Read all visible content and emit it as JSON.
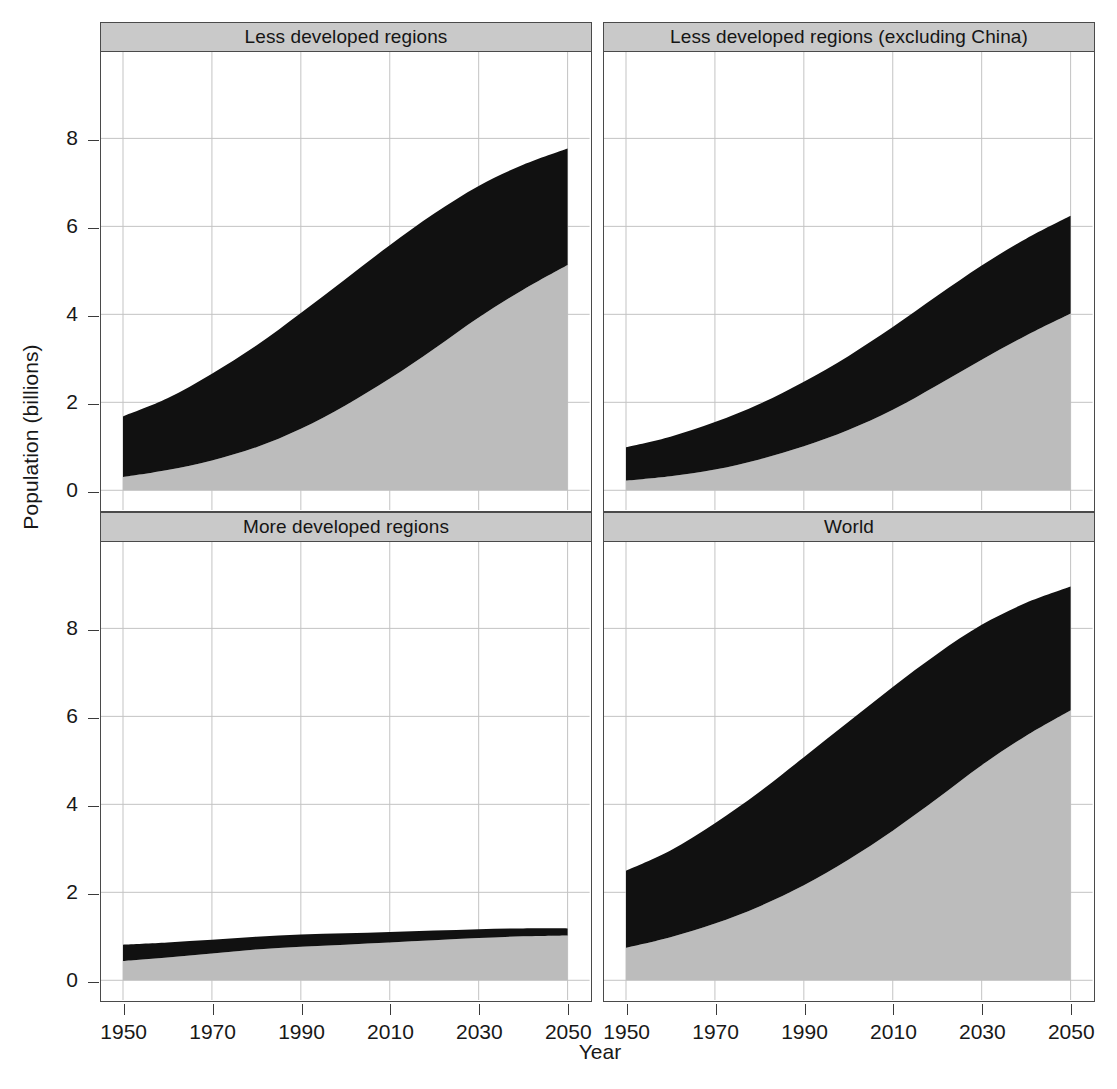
{
  "figure": {
    "x_axis_title": "Year",
    "y_axis_title": "Population (billions)"
  },
  "axes": {
    "y_ticks": [
      "0",
      "2",
      "4",
      "6",
      "8"
    ],
    "x_ticks": [
      "1950",
      "1970",
      "1990",
      "2010",
      "2030",
      "2050"
    ]
  },
  "panels": [
    {
      "key": "less_developed",
      "title": "Less developed regions"
    },
    {
      "key": "less_developed_excl_china",
      "title": "Less developed regions (excluding China)"
    },
    {
      "key": "more_developed",
      "title": "More developed regions"
    },
    {
      "key": "world",
      "title": "World"
    }
  ],
  "colors": {
    "urban_fill": "#bcbcbc",
    "rural_fill": "#111111",
    "panel_strip": "#c9c9c9",
    "panel_border": "#4a4a4a",
    "gridline": "#c3c3c3",
    "background": "#ffffff",
    "text": "#181818"
  },
  "chart_data": {
    "type": "area",
    "title": "",
    "subtitle": "",
    "xlabel": "Year",
    "ylabel": "Population (billions)",
    "xlim": [
      1950,
      2050
    ],
    "ylim": [
      0,
      9.6
    ],
    "grid": true,
    "legend": "none",
    "stacked": true,
    "series_names": [
      "Urban",
      "Rural"
    ],
    "series_colors": [
      "#bcbcbc",
      "#111111"
    ],
    "x": [
      1950,
      1960,
      1970,
      1980,
      1990,
      2000,
      2010,
      2020,
      2030,
      2040,
      2050
    ],
    "panels": [
      {
        "name": "Less developed regions",
        "xlabel": "Year",
        "ylabel": "Population (billions)",
        "series": [
          {
            "name": "Urban",
            "values": [
              0.3,
              0.46,
              0.68,
              0.98,
              1.4,
              1.93,
              2.54,
              3.22,
              3.93,
              4.56,
              5.12
            ]
          },
          {
            "name": "Rural",
            "values": [
              1.38,
              1.63,
              1.97,
              2.31,
              2.63,
              2.87,
              3.03,
              3.07,
              2.99,
              2.84,
              2.65
            ]
          }
        ],
        "totals": [
          1.68,
          2.09,
          2.65,
          3.29,
          4.03,
          4.8,
          5.57,
          6.29,
          6.92,
          7.4,
          7.77
        ]
      },
      {
        "name": "Less developed regions (excluding China)",
        "xlabel": "Year",
        "ylabel": "Population (billions)",
        "series": [
          {
            "name": "Urban",
            "values": [
              0.22,
              0.32,
              0.47,
              0.7,
              1.0,
              1.37,
              1.83,
              2.39,
              2.97,
              3.52,
              4.02
            ]
          },
          {
            "name": "Rural",
            "values": [
              0.76,
              0.9,
              1.08,
              1.26,
              1.47,
              1.68,
              1.88,
              2.03,
              2.14,
              2.2,
              2.22
            ]
          }
        ],
        "totals": [
          0.98,
          1.22,
          1.55,
          1.96,
          2.47,
          3.05,
          3.71,
          4.42,
          5.11,
          5.72,
          6.24
        ]
      },
      {
        "name": "More developed regions",
        "xlabel": "Year",
        "ylabel": "Population (billions)",
        "series": [
          {
            "name": "Urban",
            "values": [
              0.44,
              0.52,
              0.61,
              0.7,
              0.76,
              0.81,
              0.86,
              0.91,
              0.96,
              1.0,
              1.02
            ]
          },
          {
            "name": "Rural",
            "values": [
              0.37,
              0.34,
              0.31,
              0.29,
              0.28,
              0.26,
              0.24,
              0.22,
              0.2,
              0.18,
              0.16
            ]
          }
        ],
        "totals": [
          0.81,
          0.86,
          0.92,
          0.99,
          1.04,
          1.07,
          1.1,
          1.13,
          1.16,
          1.18,
          1.18
        ]
      },
      {
        "name": "World",
        "xlabel": "Year",
        "ylabel": "Population (billions)",
        "series": [
          {
            "name": "Urban",
            "values": [
              0.74,
              0.98,
              1.29,
              1.68,
              2.16,
              2.74,
              3.4,
              4.13,
              4.89,
              5.56,
              6.14
            ]
          },
          {
            "name": "Rural",
            "values": [
              1.75,
              1.97,
              2.28,
              2.6,
              2.91,
              3.13,
              3.27,
              3.29,
              3.19,
              3.02,
              2.81
            ]
          }
        ],
        "totals": [
          2.49,
          2.95,
          3.57,
          4.28,
          5.07,
          5.87,
          6.67,
          7.42,
          8.08,
          8.58,
          8.95
        ]
      }
    ]
  }
}
